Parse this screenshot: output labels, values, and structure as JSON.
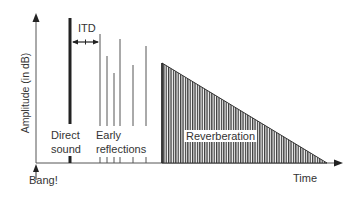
{
  "diagram": {
    "y_axis_label": "Amplitude (in dB)",
    "x_axis_label": "Time",
    "origin_label": "Bang!",
    "itd_label": "ITD",
    "direct_sound_label_line1": "Direct",
    "direct_sound_label_line2": "sound",
    "early_reflections_label_line1": "Early",
    "early_reflections_label_line2": "reflections",
    "reverberation_label": "Reverberation",
    "colors": {
      "line": "#555555",
      "text": "#333333",
      "direct_sound": "#222222",
      "background": "#ffffff"
    },
    "direct_sound": {
      "x": 70,
      "top": 18
    },
    "early_reflections": [
      {
        "x": 100,
        "top": 34
      },
      {
        "x": 107,
        "top": 56
      },
      {
        "x": 114,
        "top": 73
      },
      {
        "x": 120,
        "top": 39
      },
      {
        "x": 133,
        "top": 65
      },
      {
        "x": 146,
        "top": 46
      }
    ],
    "reverberation": {
      "x_start": 162,
      "top": 63,
      "x_end": 327
    }
  }
}
